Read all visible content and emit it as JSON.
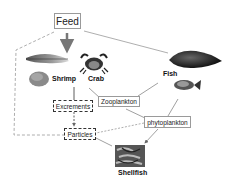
{
  "diagram": {
    "title_box": {
      "label": "Feed"
    },
    "organisms": [
      {
        "id": "shrimp",
        "label": "Shrimp"
      },
      {
        "id": "crab",
        "label": "Crab"
      },
      {
        "id": "fish",
        "label": "Fish"
      },
      {
        "id": "shellfish",
        "label": "Shellfish"
      }
    ],
    "boxes": {
      "zooplankton": "Zooplankton",
      "phytoplankton": "phytoplankton",
      "excrements": "Excrements",
      "particles": "Particles"
    },
    "edges": [
      {
        "from": "Feed",
        "to": "Shrimp/Crab",
        "style": "arrow"
      },
      {
        "from": "Feed",
        "to": "Fish",
        "style": "solid"
      },
      {
        "from": "Feed",
        "to": "Particles",
        "style": "dashed"
      },
      {
        "from": "Shrimp",
        "to": "Excrements",
        "style": "arrow"
      },
      {
        "from": "Excrements",
        "to": "Particles",
        "style": "dashed-arrow"
      },
      {
        "from": "Crab",
        "to": "Zooplankton",
        "style": "solid"
      },
      {
        "from": "Zooplankton",
        "to": "Fish",
        "style": "solid"
      },
      {
        "from": "Zooplankton",
        "to": "phytoplankton",
        "style": "solid"
      },
      {
        "from": "phytoplankton",
        "to": "Fish",
        "style": "solid"
      },
      {
        "from": "phytoplankton",
        "to": "Particles",
        "style": "dashed"
      },
      {
        "from": "phytoplankton",
        "to": "Shellfish",
        "style": "arrow"
      },
      {
        "from": "Particles",
        "to": "Shellfish",
        "style": "solid"
      }
    ],
    "colors": {
      "line": "#888888",
      "dash": "#999999",
      "arrow": "#777777",
      "text": "#111111"
    }
  }
}
